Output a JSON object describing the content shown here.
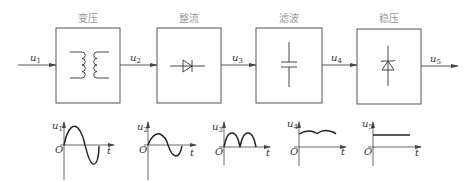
{
  "diagram": {
    "title": "",
    "stages": [
      {
        "id": "transform",
        "label": "变压",
        "symbol": "transformer-icon"
      },
      {
        "id": "rectify",
        "label": "整流",
        "symbol": "diode-icon"
      },
      {
        "id": "filter",
        "label": "滤波",
        "symbol": "capacitor-icon"
      },
      {
        "id": "regulate",
        "label": "稳压",
        "symbol": "zener-diode-icon"
      }
    ],
    "signals": [
      {
        "main": "u",
        "sub": "1"
      },
      {
        "main": "u",
        "sub": "2"
      },
      {
        "main": "u",
        "sub": "3"
      },
      {
        "main": "u",
        "sub": "4"
      },
      {
        "main": "u",
        "sub": "5"
      }
    ],
    "waveforms": [
      {
        "id": "u1",
        "shape": "sine-large",
        "ylabel_main": "u",
        "ylabel_sub": "1",
        "origin": "O",
        "xlabel": "t"
      },
      {
        "id": "u2",
        "shape": "sine-small",
        "ylabel_main": "u",
        "ylabel_sub": "2",
        "origin": "O",
        "xlabel": "t"
      },
      {
        "id": "u3",
        "shape": "full-wave-rectified",
        "ylabel_main": "u",
        "ylabel_sub": "3",
        "origin": "O",
        "xlabel": "t"
      },
      {
        "id": "u4",
        "shape": "filtered-ripple",
        "ylabel_main": "u",
        "ylabel_sub": "4",
        "origin": "O",
        "xlabel": "t"
      },
      {
        "id": "u5",
        "shape": "constant-dc",
        "ylabel_main": "u",
        "ylabel_sub": "5",
        "origin": "O",
        "xlabel": "t"
      }
    ]
  }
}
